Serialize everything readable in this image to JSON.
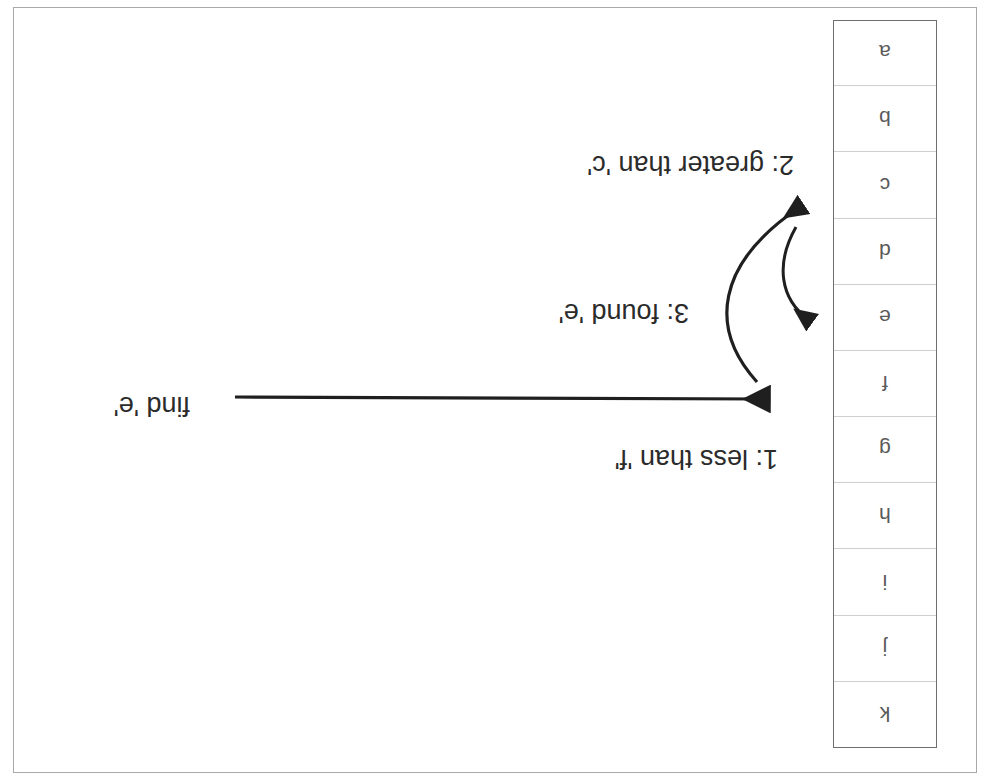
{
  "document": {
    "kind": "scanned-diagram",
    "orientation": "rotated-180",
    "title": "Binary search on a sorted array"
  },
  "array": {
    "name": "sorted-letter-array",
    "cells": [
      {
        "index": 0,
        "value": "a"
      },
      {
        "index": 1,
        "value": "b"
      },
      {
        "index": 2,
        "value": "c"
      },
      {
        "index": 3,
        "value": "d"
      },
      {
        "index": 4,
        "value": "e"
      },
      {
        "index": 5,
        "value": "f"
      },
      {
        "index": 6,
        "value": "g"
      },
      {
        "index": 7,
        "value": "h"
      },
      {
        "index": 8,
        "value": "i"
      },
      {
        "index": 9,
        "value": "j"
      },
      {
        "index": 10,
        "value": "k"
      }
    ]
  },
  "annotations": {
    "query": "find 'e'",
    "step1": "1: less than 'f'",
    "step2": "2: greater than 'c'",
    "step3": "3: found 'e'"
  },
  "colors": {
    "ink": "#2b2b2b",
    "cell_text": "#5a5a5a",
    "cell_divider": "#cfcfcf",
    "column_border": "#6e6e6e",
    "paper_border": "#a9a9a9",
    "paper": "#ffffff"
  },
  "arrows": [
    {
      "name": "query-arrow",
      "from": "find 'e'",
      "to": "cell 'f'",
      "style": "straight"
    },
    {
      "name": "step2-arrow",
      "from": "cell 'f' region",
      "to": "cell 'c'",
      "style": "curved"
    },
    {
      "name": "step3-arrow",
      "from": "cell 'c' region",
      "to": "cell 'e'",
      "style": "curved"
    }
  ]
}
